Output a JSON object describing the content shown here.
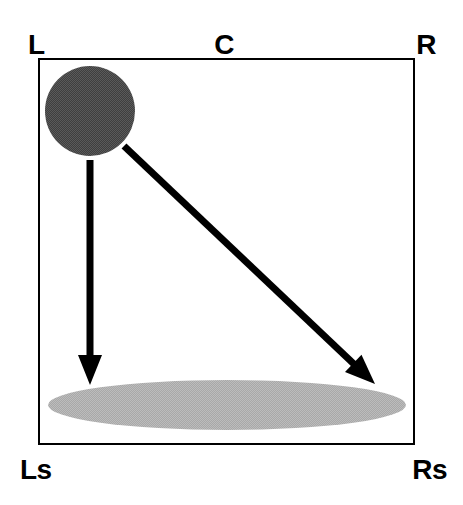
{
  "figure": {
    "background_color": "#ffffff",
    "width": 463,
    "height": 505
  },
  "frame": {
    "name": "listening-area-box",
    "stroke_color": "#000000",
    "stroke_width": 2,
    "x": 38,
    "y": 58,
    "width": 377,
    "height": 387
  },
  "labels": {
    "top_left": "L",
    "top_center": "C",
    "top_right": "R",
    "bottom_left": "Ls",
    "bottom_right": "Rs",
    "color": "#000000",
    "font_size": 28
  },
  "shapes": {
    "source": {
      "name": "source-circle",
      "fill": "#4a4a4a",
      "cx": 90,
      "cy": 111,
      "r": 45
    },
    "target": {
      "name": "target-ellipse",
      "fill": "#b0b0b0",
      "cx": 227,
      "cy": 405,
      "rx": 179,
      "ry": 25
    }
  },
  "arrows": {
    "color": "#000000",
    "shaft_width": 7,
    "vertical": {
      "name": "arrow-to-ls",
      "x1": 90,
      "y1": 160,
      "x2": 90,
      "y2": 385
    },
    "diagonal": {
      "name": "arrow-to-rs",
      "x1": 124,
      "y1": 146,
      "x2": 375,
      "y2": 384
    }
  },
  "chart_data": {
    "type": "scatter",
    "xlabel": "",
    "ylabel": "",
    "xlim": [
      0,
      1
    ],
    "ylim": [
      0,
      1
    ],
    "grid": false,
    "legend": "none",
    "channel_labels": [
      {
        "id": "L",
        "text": "L",
        "position": "top-left"
      },
      {
        "id": "C",
        "text": "C",
        "position": "top-center"
      },
      {
        "id": "R",
        "text": "R",
        "position": "top-right"
      },
      {
        "id": "Ls",
        "text": "Ls",
        "position": "bottom-left"
      },
      {
        "id": "Rs",
        "text": "Rs",
        "position": "bottom-right"
      }
    ],
    "elements": [
      {
        "name": "source-circle",
        "shape": "circle",
        "fill": "#4a4a4a",
        "center": [
          0.138,
          0.137
        ],
        "radius": 0.119
      },
      {
        "name": "target-ellipse",
        "shape": "ellipse",
        "fill": "#b0b0b0",
        "center": [
          0.501,
          0.897
        ],
        "radii": [
          0.475,
          0.065
        ]
      }
    ],
    "annotations": [
      {
        "name": "arrow-to-ls",
        "type": "arrow",
        "from": [
          0.138,
          0.264
        ],
        "to": [
          0.138,
          0.845
        ]
      },
      {
        "name": "arrow-to-rs",
        "type": "arrow",
        "from": [
          0.228,
          0.227
        ],
        "to": [
          0.894,
          0.843
        ]
      }
    ]
  }
}
